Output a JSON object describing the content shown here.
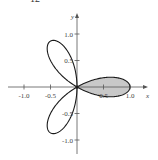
{
  "problem_number": "12",
  "chart_data": {
    "type": "line",
    "title": "",
    "curve": "r = cos(3θ) (three-leaved rose, polar)",
    "xlabel": "x",
    "ylabel": "y",
    "xlim": [
      -1.1,
      1.2
    ],
    "ylim": [
      -1.2,
      1.1
    ],
    "grid": false,
    "x_ticks": [
      "-1.0",
      "-0.5",
      "0.5",
      "1.0"
    ],
    "y_ticks": [
      "1.0",
      "0.5",
      "-0.5",
      "-1.0"
    ],
    "shaded_region": "petal along positive x-axis, -π/6 ≤ θ ≤ π/6",
    "petals": [
      {
        "tip": [
          1.0,
          0.0
        ],
        "shaded": true
      },
      {
        "tip": [
          -0.5,
          0.866
        ],
        "shaded": false
      },
      {
        "tip": [
          -0.5,
          -0.866
        ],
        "shaded": false
      }
    ],
    "colors": {
      "curve": "#1a1a1a",
      "shade": "#c8c8c8",
      "axes": "#555555"
    }
  }
}
